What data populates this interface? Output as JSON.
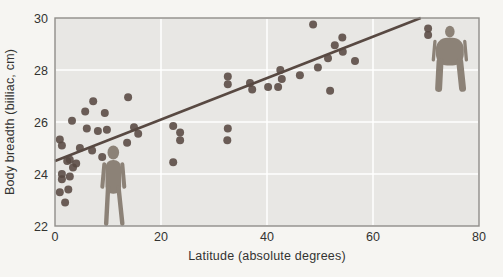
{
  "figure": {
    "colors": {
      "page_bg": "#f6f5f2",
      "plot_bg": "#e8e7e4",
      "grid": "#ffffff",
      "border": "#908e8a",
      "point": "#584942",
      "regression_line": "#584942",
      "silhouette": "#8c8277",
      "text": "#333331"
    }
  },
  "chart_data": {
    "type": "scatter",
    "title": "",
    "xlabel": "Latitude (absolute degrees)",
    "ylabel": "Body breadth (biiliac, cm)",
    "xlim": [
      0,
      80
    ],
    "ylim": [
      22,
      30
    ],
    "xticks": [
      0,
      20,
      40,
      60,
      80
    ],
    "yticks": [
      22,
      24,
      26,
      28,
      30
    ],
    "grid": true,
    "legend": "none",
    "point_radius_px": 4,
    "points": [
      [
        0.9,
        25.33
      ],
      [
        1.3,
        25.1
      ],
      [
        3.2,
        26.05
      ],
      [
        5.7,
        26.4
      ],
      [
        7.2,
        26.8
      ],
      [
        9.4,
        26.35
      ],
      [
        13.8,
        26.95
      ],
      [
        6.0,
        25.75
      ],
      [
        8.1,
        25.65
      ],
      [
        9.8,
        25.7
      ],
      [
        14.9,
        25.8
      ],
      [
        15.7,
        25.55
      ],
      [
        4.7,
        25.0
      ],
      [
        7.0,
        24.9
      ],
      [
        13.6,
        25.2
      ],
      [
        8.9,
        24.65
      ],
      [
        2.8,
        24.55
      ],
      [
        2.3,
        24.5
      ],
      [
        4.0,
        24.4
      ],
      [
        3.4,
        24.25
      ],
      [
        1.3,
        24.0
      ],
      [
        2.8,
        23.9
      ],
      [
        1.3,
        23.8
      ],
      [
        2.5,
        23.4
      ],
      [
        0.9,
        23.3
      ],
      [
        1.9,
        22.9
      ],
      [
        22.3,
        25.85
      ],
      [
        23.6,
        25.6
      ],
      [
        23.6,
        25.3
      ],
      [
        22.3,
        24.45
      ],
      [
        32.6,
        27.75
      ],
      [
        32.6,
        27.45
      ],
      [
        32.6,
        25.75
      ],
      [
        32.5,
        25.3
      ],
      [
        36.8,
        27.5
      ],
      [
        37.2,
        27.25
      ],
      [
        40.2,
        27.35
      ],
      [
        42.1,
        27.35
      ],
      [
        42.5,
        28.0
      ],
      [
        42.8,
        27.65
      ],
      [
        46.2,
        27.8
      ],
      [
        48.7,
        29.75
      ],
      [
        49.6,
        28.1
      ],
      [
        51.5,
        28.45
      ],
      [
        51.9,
        27.2
      ],
      [
        52.8,
        28.95
      ],
      [
        54.2,
        29.25
      ],
      [
        54.3,
        28.7
      ],
      [
        56.6,
        28.35
      ],
      [
        70.4,
        29.6
      ],
      [
        70.4,
        29.35
      ]
    ],
    "regression_line": {
      "x1": 0,
      "y1": 24.5,
      "x2": 69,
      "y2": 30.0
    },
    "annotations": [
      {
        "name": "slender-person-silhouette",
        "meaning": "slender body build near equator",
        "lat": 11.0,
        "breadth_feet": 22.0,
        "breadth_head": 25.1,
        "build": "slender"
      },
      {
        "name": "broad-person-silhouette",
        "meaning": "broad body build at high latitude",
        "lat": 74.5,
        "breadth_feet": 27.15,
        "breadth_head": 29.7,
        "build": "broad"
      }
    ],
    "plot_area_px": {
      "left": 55,
      "top": 18,
      "right": 479,
      "bottom": 226,
      "svg_width": 503,
      "svg_height": 277
    }
  }
}
